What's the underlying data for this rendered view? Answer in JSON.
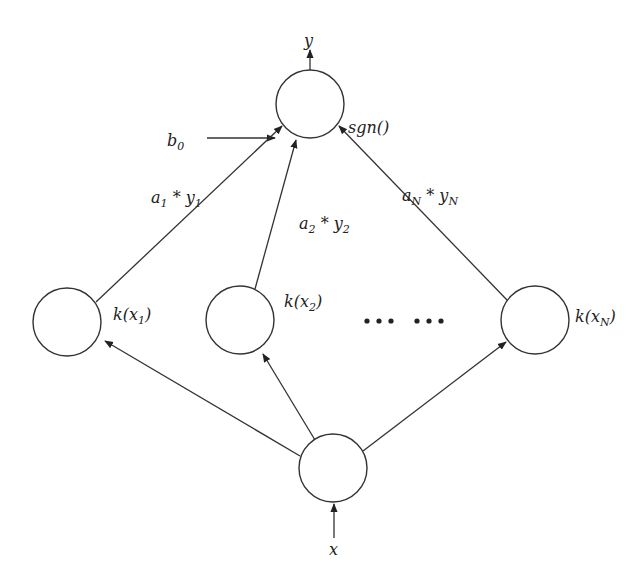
{
  "diagram": {
    "title": "",
    "nodes": [
      {
        "id": "output",
        "label": "sgn()",
        "cx": 310,
        "cy": 104
      },
      {
        "id": "k1",
        "label_base": "k(x",
        "label_sub": "1",
        "label_end": ")",
        "cx": 67,
        "cy": 322
      },
      {
        "id": "k2",
        "label_base": "k(x",
        "label_sub": "2",
        "label_end": ")",
        "cx": 240,
        "cy": 320
      },
      {
        "id": "kN",
        "label_base": "k(x",
        "label_sub": "N",
        "label_end": ")",
        "cx": 535,
        "cy": 320
      },
      {
        "id": "input",
        "label": "",
        "cx": 333,
        "cy": 468
      }
    ],
    "labels": {
      "output": "y",
      "input": "x",
      "bias_base": "b",
      "bias_sub": "0",
      "ellipsis": "… …",
      "sgn": "sgn()",
      "w1": {
        "a": "a",
        "a_sub": "1",
        "op": " * ",
        "y": "y",
        "y_sub": "1"
      },
      "w2": {
        "a": "a",
        "a_sub": "2",
        "op": " * ",
        "y": "y",
        "y_sub": "2"
      },
      "wN": {
        "a": "a",
        "a_sub": "N",
        "op": " * ",
        "y": "y",
        "y_sub": "N"
      }
    },
    "edges": [
      {
        "from": "input",
        "to": "k1"
      },
      {
        "from": "input",
        "to": "k2"
      },
      {
        "from": "input",
        "to": "kN"
      },
      {
        "from": "k1",
        "to": "output",
        "weight": "a1 * y1"
      },
      {
        "from": "k2",
        "to": "output",
        "weight": "a2 * y2"
      },
      {
        "from": "kN",
        "to": "output",
        "weight": "aN * yN"
      },
      {
        "from": "b0",
        "to": "output"
      },
      {
        "from": "x",
        "to": "input"
      },
      {
        "from": "output",
        "to": "y"
      }
    ]
  }
}
